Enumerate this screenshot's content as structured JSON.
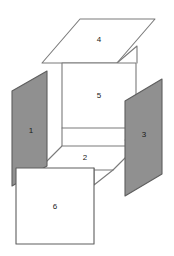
{
  "diagram": {
    "canvas": {
      "width": 174,
      "height": 256,
      "background": "#ffffff"
    },
    "colors": {
      "shaded_fill": "#909090",
      "plain_fill": "#ffffff",
      "stroke": "#7a7a7a",
      "stroke_dark": "#5e5e5e",
      "label_color": "#1a1a1a"
    },
    "faces": [
      {
        "id": "face-1",
        "label": "1",
        "shading": "shaded",
        "fill": "#909090",
        "label_x": 31,
        "label_y": 131,
        "points": "47,71 47,166 12,186 12,91"
      },
      {
        "id": "face-2",
        "label": "2",
        "shading": "plain",
        "fill": "#ffffff",
        "label_x": 85,
        "label_y": 158,
        "points": "62,146 137,146 113,170 38,170"
      },
      {
        "id": "face-3",
        "label": "3",
        "shading": "shaded",
        "fill": "#909090",
        "label_x": 144,
        "label_y": 135,
        "points": "162,79 162,174 125,196 125,101"
      },
      {
        "id": "face-4",
        "label": "4",
        "shading": "plain",
        "fill": "#ffffff",
        "label_x": 99,
        "label_y": 40,
        "points": "80,19 155,19 117,63 42,63"
      },
      {
        "id": "face-5",
        "label": "5",
        "shading": "plain",
        "fill": "#ffffff",
        "label_x": 99,
        "label_y": 96,
        "points": "62,63 136,63 136,128 62,128"
      },
      {
        "id": "face-6",
        "label": "6",
        "shading": "plain",
        "fill": "#ffffff",
        "label_x": 55,
        "label_y": 207,
        "points": "16,168 94,168 94,244 16,244"
      }
    ],
    "connectors": [
      {
        "id": "connector-4-to-5-right",
        "points": "117,63 137,46 137,63"
      },
      {
        "id": "connector-5-to-3-right",
        "points": "136,128 136,140 125,140"
      },
      {
        "id": "connector-5-left-to-2",
        "points": "62,128 62,146"
      },
      {
        "id": "connector-1-to-2",
        "points": "47,166 38,170"
      },
      {
        "id": "connector-2-to-6",
        "points": "113,170 94,185 94,168"
      },
      {
        "id": "connector-3-left-edge-top",
        "points": "125,140 125,101"
      }
    ]
  }
}
